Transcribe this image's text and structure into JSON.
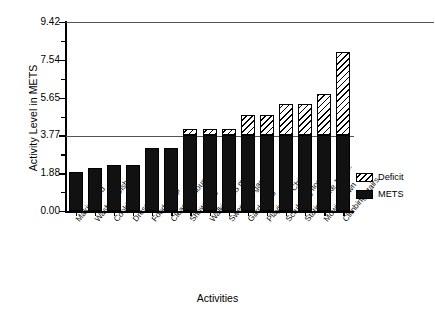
{
  "chart_data": {
    "type": "bar",
    "stacked": true,
    "title": "",
    "xlabel": "Activities",
    "ylabel": "Activity Level in METS",
    "ylim": [
      0.0,
      9.42
    ],
    "ytick_labels": [
      "0.00",
      "1.88",
      "3.77",
      "5.65",
      "7.54",
      "9.42"
    ],
    "ytick_values": [
      0.0,
      1.88,
      3.77,
      5.65,
      7.54,
      9.42
    ],
    "minor_ticks": true,
    "grid": false,
    "reference_line": 3.77,
    "legend_position": "right-outside",
    "categories": [
      "Making bed",
      "Washing Dishes",
      "Cooking",
      "Dressing",
      "Food Shop",
      "Cleaning house",
      "Showering",
      "Walking 3.5 mph",
      "Sweeping garage",
      "Gardening",
      "Playing w. Childr",
      "Scrubbing floor",
      "Station. bike 100 w.",
      "Mowing lawn",
      "Climbing stairs"
    ],
    "series": [
      {
        "name": "METS",
        "values": [
          1.94,
          2.14,
          2.29,
          2.29,
          3.14,
          3.14,
          3.77,
          3.77,
          3.77,
          3.77,
          3.77,
          3.77,
          3.77,
          3.77,
          3.77
        ]
      },
      {
        "name": "Deficit",
        "values": [
          0.0,
          0.0,
          0.0,
          0.0,
          0.0,
          0.0,
          0.32,
          0.32,
          0.32,
          1.01,
          1.01,
          1.56,
          1.56,
          2.06,
          4.16
        ]
      }
    ],
    "totals": [
      1.94,
      2.14,
      2.29,
      2.29,
      3.14,
      3.14,
      4.09,
      4.09,
      4.09,
      4.78,
      4.78,
      5.33,
      5.33,
      5.83,
      7.93
    ]
  },
  "legend": {
    "items": [
      {
        "label": "Deficit",
        "pattern": "diagonal-hatch",
        "color": "#ffffff"
      },
      {
        "label": "METS",
        "pattern": "solid",
        "color": "#111111"
      }
    ]
  }
}
